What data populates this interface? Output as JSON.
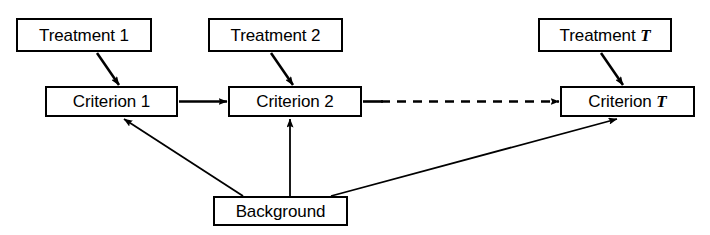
{
  "diagram": {
    "colors": {
      "stroke": "#000000",
      "fill": "#ffffff",
      "text": "#000000",
      "page_background": "#ffffff"
    },
    "nodes": [
      {
        "id": "treatment-1",
        "label_prefix": "Treatment ",
        "label_symbol": "1",
        "symbol_italic": false,
        "row": "treatments"
      },
      {
        "id": "treatment-2",
        "label_prefix": "Treatment ",
        "label_symbol": "2",
        "symbol_italic": false,
        "row": "treatments"
      },
      {
        "id": "treatment-t",
        "label_prefix": "Treatment ",
        "label_symbol": "T",
        "symbol_italic": true,
        "row": "treatments"
      },
      {
        "id": "criterion-1",
        "label_prefix": "Criterion ",
        "label_symbol": "1",
        "symbol_italic": false,
        "row": "criteria"
      },
      {
        "id": "criterion-2",
        "label_prefix": "Criterion ",
        "label_symbol": "2",
        "symbol_italic": false,
        "row": "criteria"
      },
      {
        "id": "criterion-t",
        "label_prefix": "Criterion ",
        "label_symbol": "T",
        "symbol_italic": true,
        "row": "criteria"
      },
      {
        "id": "background",
        "label_prefix": "Background",
        "label_symbol": "",
        "symbol_italic": false,
        "row": "background"
      }
    ],
    "edges": [
      {
        "id": "treatment-1-to-criterion-1",
        "from": "treatment-1",
        "to": "criterion-1",
        "style": "solid",
        "arrowhead": "filled"
      },
      {
        "id": "treatment-2-to-criterion-2",
        "from": "treatment-2",
        "to": "criterion-2",
        "style": "solid",
        "arrowhead": "filled"
      },
      {
        "id": "treatment-t-to-criterion-t",
        "from": "treatment-t",
        "to": "criterion-t",
        "style": "solid",
        "arrowhead": "filled"
      },
      {
        "id": "criterion-1-to-criterion-2",
        "from": "criterion-1",
        "to": "criterion-2",
        "style": "solid",
        "arrowhead": "filled"
      },
      {
        "id": "criterion-2-to-criterion-t",
        "from": "criterion-2",
        "to": "criterion-t",
        "style": "dashed",
        "arrowhead": "filled"
      },
      {
        "id": "background-to-criterion-1",
        "from": "background",
        "to": "criterion-1",
        "style": "solid",
        "arrowhead": "filled"
      },
      {
        "id": "background-to-criterion-2",
        "from": "background",
        "to": "criterion-2",
        "style": "solid",
        "arrowhead": "filled"
      },
      {
        "id": "background-to-criterion-t",
        "from": "background",
        "to": "criterion-t",
        "style": "solid",
        "arrowhead": "filled"
      }
    ]
  },
  "labels": {
    "treatment_1": "Treatment 1",
    "treatment_2": "Treatment 2",
    "treatment_t_prefix": "Treatment ",
    "treatment_t_symbol": "T",
    "criterion_1": "Criterion 1",
    "criterion_2": "Criterion 2",
    "criterion_t_prefix": "Criterion ",
    "criterion_t_symbol": "T",
    "background": "Background"
  }
}
